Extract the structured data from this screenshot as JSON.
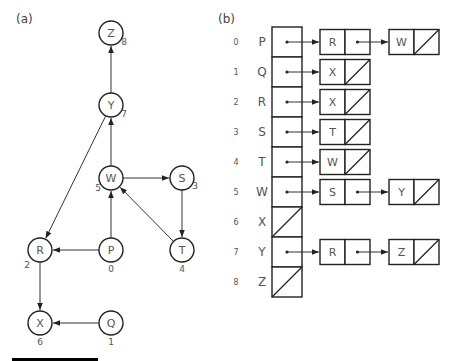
{
  "panel_a": {
    "label": "(a)",
    "node_radius": 12,
    "nodes": [
      {
        "id": "P",
        "index": "0",
        "x": 111,
        "y": 250,
        "idx_dx": 0,
        "idx_dy": 19
      },
      {
        "id": "Q",
        "index": "1",
        "x": 111,
        "y": 323,
        "idx_dx": 0,
        "idx_dy": 19
      },
      {
        "id": "R",
        "index": "2",
        "x": 40,
        "y": 250,
        "idx_dx": -13,
        "idx_dy": 15
      },
      {
        "id": "S",
        "index": "3",
        "x": 182,
        "y": 178,
        "idx_dx": 13,
        "idx_dy": 8
      },
      {
        "id": "T",
        "index": "4",
        "x": 182,
        "y": 250,
        "idx_dx": 0,
        "idx_dy": 19
      },
      {
        "id": "W",
        "index": "5",
        "x": 111,
        "y": 178,
        "idx_dx": -13,
        "idx_dy": 10
      },
      {
        "id": "X",
        "index": "6",
        "x": 40,
        "y": 323,
        "idx_dx": 0,
        "idx_dy": 19
      },
      {
        "id": "Y",
        "index": "7",
        "x": 111,
        "y": 105,
        "idx_dx": 13,
        "idx_dy": 9
      },
      {
        "id": "Z",
        "index": "8",
        "x": 111,
        "y": 33,
        "idx_dx": 13,
        "idx_dy": 9
      }
    ],
    "edges": [
      {
        "from": "P",
        "to": "R"
      },
      {
        "from": "P",
        "to": "W"
      },
      {
        "from": "Q",
        "to": "X"
      },
      {
        "from": "R",
        "to": "X"
      },
      {
        "from": "S",
        "to": "T"
      },
      {
        "from": "T",
        "to": "W"
      },
      {
        "from": "W",
        "to": "S"
      },
      {
        "from": "W",
        "to": "Y"
      },
      {
        "from": "Y",
        "to": "R"
      },
      {
        "from": "Y",
        "to": "Z"
      }
    ],
    "bar": {
      "x": 12,
      "y": 358,
      "width": 86,
      "height": 3
    }
  },
  "panel_b": {
    "label": "(b)",
    "array": {
      "x": 272,
      "y": 27,
      "width": 30,
      "row_height": 30
    },
    "node_cell_width": 25,
    "node_height": 25,
    "list_columns_x": [
      320,
      389
    ],
    "rows": [
      {
        "index": "0",
        "vertex": "P",
        "adjacent": [
          "R",
          "W"
        ]
      },
      {
        "index": "1",
        "vertex": "Q",
        "adjacent": [
          "X"
        ]
      },
      {
        "index": "2",
        "vertex": "R",
        "adjacent": [
          "X"
        ]
      },
      {
        "index": "3",
        "vertex": "S",
        "adjacent": [
          "T"
        ]
      },
      {
        "index": "4",
        "vertex": "T",
        "adjacent": [
          "W"
        ]
      },
      {
        "index": "5",
        "vertex": "W",
        "adjacent": [
          "S",
          "Y"
        ]
      },
      {
        "index": "6",
        "vertex": "X",
        "adjacent": []
      },
      {
        "index": "7",
        "vertex": "Y",
        "adjacent": [
          "R",
          "Z"
        ]
      },
      {
        "index": "8",
        "vertex": "Z",
        "adjacent": []
      }
    ]
  }
}
